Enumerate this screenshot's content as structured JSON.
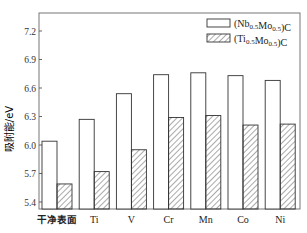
{
  "chart_data": {
    "type": "bar",
    "title": "",
    "xlabel": "",
    "ylabel": "吸附能/eV",
    "ylim": [
      5.3,
      7.45
    ],
    "yticks": [
      5.4,
      5.7,
      6.0,
      6.3,
      6.6,
      6.9,
      7.2
    ],
    "categories": [
      "干净表面",
      "Ti",
      "V",
      "Cr",
      "Mn",
      "Co",
      "Ni"
    ],
    "series": [
      {
        "name": "(Nb0.5Mo0.5)C",
        "name_main": "(Nb",
        "sub1": "0.5",
        "mid": "Mo",
        "sub2": "0.5",
        "tail": ")C",
        "pattern": "open",
        "values": [
          6.04,
          6.27,
          6.54,
          6.74,
          6.76,
          6.73,
          6.68
        ]
      },
      {
        "name": "(Ti0.5Mo0.5)C",
        "name_main": "(Ti",
        "sub1": "0.5",
        "mid": "Mo",
        "sub2": "0.5",
        "tail": ")C",
        "pattern": "hatched",
        "values": [
          5.59,
          5.72,
          5.95,
          6.29,
          6.31,
          6.21,
          6.22
        ]
      }
    ],
    "legend_position": "upper right",
    "grid": false
  },
  "colors": {
    "axis": "#555555",
    "bar_edge": "#333333",
    "hatch": "#555555",
    "fill": "#ffffff"
  }
}
